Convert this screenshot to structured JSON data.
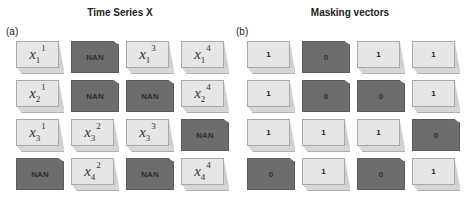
{
  "panels": [
    {
      "id": "a",
      "label": "(a)",
      "title": "Time Series X",
      "rows": [
        [
          {
            "type": "var",
            "base": "x",
            "sub": "1",
            "sup": "1"
          },
          {
            "type": "nan",
            "text": "NAN"
          },
          {
            "type": "var",
            "base": "x",
            "sub": "1",
            "sup": "3"
          },
          {
            "type": "var",
            "base": "x",
            "sub": "1",
            "sup": "4"
          }
        ],
        [
          {
            "type": "var",
            "base": "x",
            "sub": "2",
            "sup": "1"
          },
          {
            "type": "nan",
            "text": "NAN"
          },
          {
            "type": "nan",
            "text": "NAN"
          },
          {
            "type": "var",
            "base": "x",
            "sub": "2",
            "sup": "4"
          }
        ],
        [
          {
            "type": "var",
            "base": "x",
            "sub": "3",
            "sup": "1"
          },
          {
            "type": "var",
            "base": "x",
            "sub": "3",
            "sup": "2"
          },
          {
            "type": "var",
            "base": "x",
            "sub": "3",
            "sup": "3"
          },
          {
            "type": "nan",
            "text": "NAN"
          }
        ],
        [
          {
            "type": "nan",
            "text": "NAN"
          },
          {
            "type": "var",
            "base": "x",
            "sub": "4",
            "sup": "2"
          },
          {
            "type": "nan",
            "text": "NAN"
          },
          {
            "type": "var",
            "base": "x",
            "sub": "4",
            "sup": "4"
          }
        ]
      ]
    },
    {
      "id": "b",
      "label": "(b)",
      "title": "Masking vectors",
      "rows": [
        [
          {
            "type": "mask",
            "text": "1"
          },
          {
            "type": "mask",
            "text": "0"
          },
          {
            "type": "mask",
            "text": "1"
          },
          {
            "type": "mask",
            "text": "1"
          }
        ],
        [
          {
            "type": "mask",
            "text": "1"
          },
          {
            "type": "mask",
            "text": "0"
          },
          {
            "type": "mask",
            "text": "0"
          },
          {
            "type": "mask",
            "text": "1"
          }
        ],
        [
          {
            "type": "mask",
            "text": "1"
          },
          {
            "type": "mask",
            "text": "1"
          },
          {
            "type": "mask",
            "text": "1"
          },
          {
            "type": "mask",
            "text": "0"
          }
        ],
        [
          {
            "type": "mask",
            "text": "0"
          },
          {
            "type": "mask",
            "text": "1"
          },
          {
            "type": "mask",
            "text": "0"
          },
          {
            "type": "mask",
            "text": "1"
          }
        ]
      ]
    }
  ],
  "colors": {
    "observed_cell": "#e6e6e6",
    "missing_cell": "#6d6d6d"
  }
}
